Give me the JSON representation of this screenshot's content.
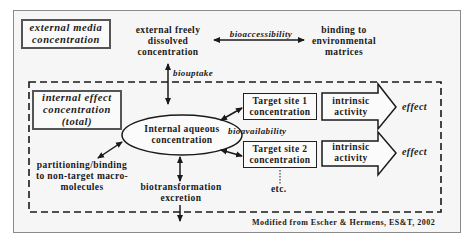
{
  "diagram": {
    "external_box": {
      "line1": "external media",
      "line2": "concentration"
    },
    "internal_box": {
      "line1": "internal effect",
      "line2": "concentration",
      "line3": "(total)"
    },
    "external_dissolved": {
      "line1": "external freely",
      "line2": "dissolved",
      "line3": "concentration"
    },
    "binding_env": {
      "line1": "binding to",
      "line2": "environmental",
      "line3": "matrices"
    },
    "bioaccessibility_label": "bioaccessibility",
    "biouptake_label": "biouptake",
    "center_node": {
      "line1": "Internal aqueous",
      "line2": "concentration"
    },
    "bioavailability_label": "bioavailability",
    "target_sites": [
      {
        "line1": "Target site 1",
        "line2": "concentration",
        "activity1": "intrinsic",
        "activity2": "activity",
        "effect": "effect"
      },
      {
        "line1": "Target site 2",
        "line2": "concentration",
        "activity1": "intrinsic",
        "activity2": "activity",
        "effect": "effect"
      }
    ],
    "etc_label": "etc.",
    "partitioning": {
      "line1": "partitioning/binding",
      "line2": "to non-target macro-",
      "line3": "molecules"
    },
    "biotransformation": {
      "line1": "biotransformation",
      "line2": "excretion"
    },
    "credit": "Modified from Escher & Hermens, ES&T, 2002"
  },
  "colors": {
    "frame_bg": "#f6f6f6",
    "line": "#1a1a1a",
    "box_border": "#555555"
  }
}
